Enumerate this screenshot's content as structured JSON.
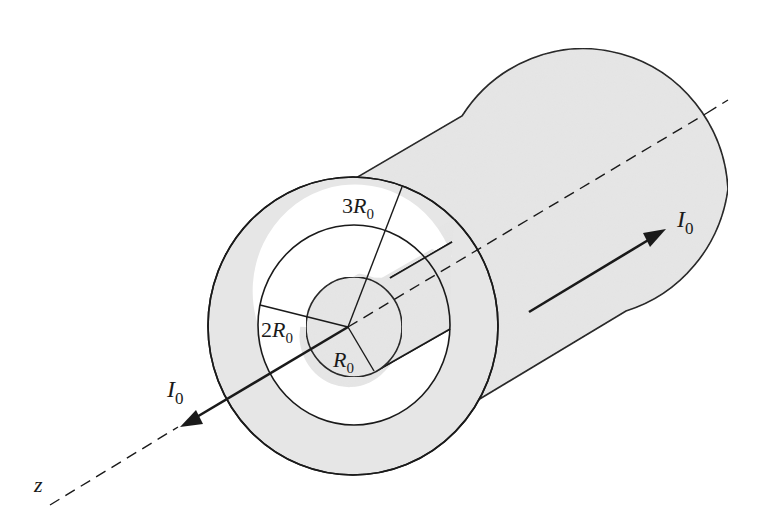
{
  "figure": {
    "colors": {
      "conductor_fill": "#e6e6e6",
      "stroke": "#1a1a1a",
      "background": "#ffffff"
    },
    "labels": {
      "axis": "z",
      "inner_radius": {
        "coef": "",
        "symbol": "R",
        "sub": "0"
      },
      "shell_inner_radius": {
        "coef": "2",
        "symbol": "R",
        "sub": "0"
      },
      "shell_outer_radius": {
        "coef": "3",
        "symbol": "R",
        "sub": "0"
      },
      "current_inner": {
        "symbol": "I",
        "sub": "0",
        "direction": "toward viewer (+z)"
      },
      "current_outer": {
        "symbol": "I",
        "sub": "0",
        "direction": "away from viewer (-z)"
      }
    }
  }
}
